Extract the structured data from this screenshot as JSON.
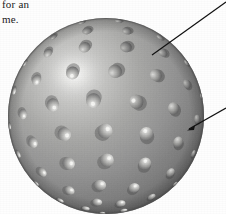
{
  "figure": {
    "kind": "bump-mapped-sphere-illustration",
    "background_color": "#fefefe"
  },
  "body_copy": {
    "line_1": "for an",
    "line_2": "me."
  },
  "caption_fragments": {
    "frag_1": "",
    "frag_2": "",
    "frag_3": ""
  },
  "sphere": {
    "center_x": 106,
    "center_y": 116,
    "radius": 98,
    "light_direction": "upper-left",
    "highlight_x": 74,
    "highlight_y": 74,
    "colors": {
      "highlight": "#f4f4f2",
      "lit": "#c8c8c6",
      "mid": "#9a9a9a",
      "shade": "#7a7a7a",
      "terminator": "#636363",
      "rim": "#555555",
      "bump_highlight": "#e9e9e7",
      "bump_shadow": "#5f5f5f",
      "outline": "#4a4a4a"
    },
    "bump_count": 88,
    "bump_rows": 9,
    "bump_base_radius": 7.5
  },
  "annotations": [
    {
      "id": "leader-top",
      "from_x": 226,
      "from_y": 2,
      "to_x": 152,
      "to_y": 55,
      "target": "sphere-surface-shading",
      "color": "#111111"
    },
    {
      "id": "leader-bottom",
      "from_x": 226,
      "from_y": 108,
      "to_x": 189,
      "to_y": 129,
      "target": "single-bump",
      "color": "#111111",
      "has_arrowhead": true
    }
  ]
}
